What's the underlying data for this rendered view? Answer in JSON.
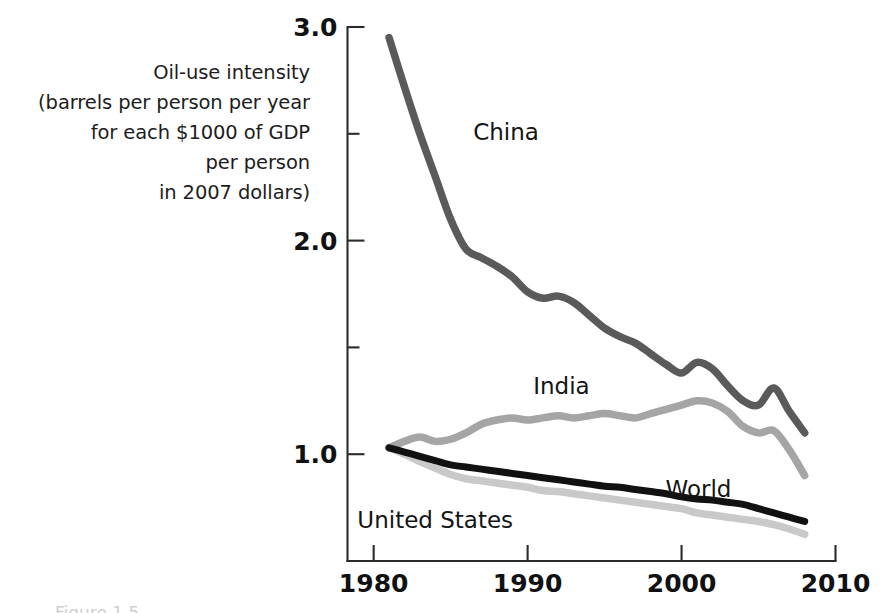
{
  "figure": {
    "axis_caption_lines": [
      "Oil-use intensity",
      "(barrels per person per year",
      "for each $1000 of GDP",
      "per person",
      "in 2007 dollars)"
    ],
    "caption_fragment": "Figure 1.5"
  },
  "chart_data": {
    "type": "line",
    "title": "",
    "subtitle": "",
    "xlabel": "",
    "ylabel": "Oil-use intensity (barrels per person per year for each $1000 of GDP per person in 2007 dollars)",
    "xlim": [
      1978.3,
      2010
    ],
    "ylim": [
      0.5,
      3.05
    ],
    "grid": false,
    "legend_position": "inline-annotations",
    "x_ticks": [
      1980,
      1990,
      2000,
      2010
    ],
    "x_tick_labels": [
      "1980",
      "1990",
      "2000",
      "2010"
    ],
    "y_ticks": [
      1.0,
      1.5,
      2.0,
      2.5,
      3.0
    ],
    "y_tick_labels": [
      "1.0",
      "",
      "2.0",
      "",
      "3.0"
    ],
    "y_major_labeled": [
      "1.0",
      "2.0",
      "3.0"
    ],
    "colors": {
      "china": "#5a5a5a",
      "india": "#a5a5a5",
      "world": "#111111",
      "united_states": "#c9c9c9"
    },
    "annotations": [
      {
        "text": "China",
        "x": 1988.6,
        "y": 2.47
      },
      {
        "text": "India",
        "x": 1992.2,
        "y": 1.28
      },
      {
        "text": "World",
        "x": 2001.1,
        "y": 0.8
      },
      {
        "text": "United States",
        "x": 1984.0,
        "y": 0.655
      }
    ],
    "x": [
      1981,
      1982,
      1983,
      1984,
      1985,
      1986,
      1987,
      1988,
      1989,
      1990,
      1991,
      1992,
      1993,
      1994,
      1995,
      1996,
      1997,
      1998,
      1999,
      2000,
      2001,
      2002,
      2003,
      2004,
      2005,
      2006,
      2007,
      2008
    ],
    "series": [
      {
        "name": "China",
        "color": "#5a5a5a",
        "values": [
          2.95,
          2.72,
          2.5,
          2.3,
          2.1,
          1.96,
          1.92,
          1.88,
          1.83,
          1.76,
          1.73,
          1.74,
          1.71,
          1.65,
          1.59,
          1.55,
          1.52,
          1.47,
          1.42,
          1.38,
          1.43,
          1.4,
          1.32,
          1.25,
          1.23,
          1.31,
          1.2,
          1.1
        ]
      },
      {
        "name": "India",
        "color": "#a5a5a5",
        "values": [
          1.03,
          1.06,
          1.08,
          1.06,
          1.07,
          1.1,
          1.14,
          1.16,
          1.17,
          1.16,
          1.17,
          1.18,
          1.17,
          1.18,
          1.19,
          1.18,
          1.17,
          1.19,
          1.21,
          1.23,
          1.25,
          1.24,
          1.2,
          1.13,
          1.1,
          1.11,
          1.02,
          0.9
        ]
      },
      {
        "name": "World",
        "color": "#111111",
        "values": [
          1.03,
          1.01,
          0.99,
          0.97,
          0.95,
          0.94,
          0.93,
          0.92,
          0.91,
          0.9,
          0.89,
          0.88,
          0.87,
          0.86,
          0.85,
          0.845,
          0.835,
          0.825,
          0.815,
          0.8,
          0.79,
          0.785,
          0.775,
          0.765,
          0.745,
          0.725,
          0.705,
          0.685
        ]
      },
      {
        "name": "United States",
        "color": "#c9c9c9",
        "values": [
          1.03,
          1.0,
          0.965,
          0.935,
          0.905,
          0.885,
          0.875,
          0.865,
          0.855,
          0.845,
          0.83,
          0.825,
          0.815,
          0.805,
          0.795,
          0.785,
          0.775,
          0.765,
          0.755,
          0.745,
          0.725,
          0.715,
          0.705,
          0.695,
          0.685,
          0.67,
          0.65,
          0.625
        ]
      }
    ]
  }
}
